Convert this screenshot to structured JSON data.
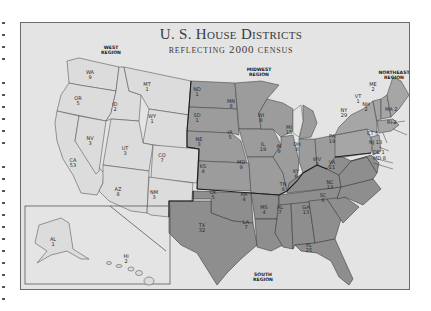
{
  "map": {
    "title": "U. S. House Districts",
    "subtitle": "reflecting 2000 census",
    "colors": {
      "background": "#e4e4e4",
      "west": "#dcdcdc",
      "midwest": "#9c9c9c",
      "south": "#8e8e8e",
      "northeast": "#a6a6a6",
      "frame": "#6a6a6a"
    },
    "regions": {
      "west": {
        "line1": "WEST",
        "line2": "REGION"
      },
      "midwest": {
        "line1": "MIDWEST",
        "line2": "REGION"
      },
      "northeast": {
        "line1": "NORTHEAST",
        "line2": "REGION"
      },
      "south": {
        "line1": "SOUTH",
        "line2": "REGION"
      }
    },
    "states": {
      "WA": {
        "abbr": "WA",
        "districts": "9"
      },
      "OR": {
        "abbr": "OR",
        "districts": "5"
      },
      "CA": {
        "abbr": "CA",
        "districts": "53"
      },
      "NV": {
        "abbr": "NV",
        "districts": "3"
      },
      "ID": {
        "abbr": "ID",
        "districts": "2"
      },
      "MT": {
        "abbr": "MT",
        "districts": "1"
      },
      "WY": {
        "abbr": "WY",
        "districts": "1"
      },
      "UT": {
        "abbr": "UT",
        "districts": "3"
      },
      "CO": {
        "abbr": "CO",
        "districts": "7"
      },
      "AZ": {
        "abbr": "AZ",
        "districts": "8"
      },
      "NM": {
        "abbr": "NM",
        "districts": "3"
      },
      "AK": {
        "abbr": "AL",
        "districts": "1"
      },
      "HI": {
        "abbr": "HI",
        "districts": "2"
      },
      "ND": {
        "abbr": "ND",
        "districts": "1"
      },
      "SD": {
        "abbr": "SD",
        "districts": "1"
      },
      "NE": {
        "abbr": "NE",
        "districts": "3"
      },
      "KS": {
        "abbr": "KS",
        "districts": "4"
      },
      "MN": {
        "abbr": "MN",
        "districts": "8"
      },
      "IA": {
        "abbr": "IA",
        "districts": "5"
      },
      "MO": {
        "abbr": "MO",
        "districts": "9"
      },
      "WI": {
        "abbr": "WI",
        "districts": "8"
      },
      "IL": {
        "abbr": "IL",
        "districts": "19"
      },
      "MI": {
        "abbr": "MI",
        "districts": "15"
      },
      "IN": {
        "abbr": "IN",
        "districts": "9"
      },
      "OH": {
        "abbr": "OH",
        "districts": "8"
      },
      "OK": {
        "abbr": "OK",
        "districts": "5"
      },
      "TX": {
        "abbr": "TX",
        "districts": "32"
      },
      "AR": {
        "abbr": "AR",
        "districts": "4"
      },
      "LA": {
        "abbr": "LA",
        "districts": "7"
      },
      "MS": {
        "abbr": "MS",
        "districts": "4"
      },
      "AL": {
        "abbr": "AL",
        "districts": "7"
      },
      "TN": {
        "abbr": "TN",
        "districts": "9"
      },
      "KY": {
        "abbr": "KY",
        "districts": "6"
      },
      "GA": {
        "abbr": "GA",
        "districts": "13"
      },
      "FL": {
        "abbr": "FL",
        "districts": "25"
      },
      "SC": {
        "abbr": "SC",
        "districts": "6"
      },
      "NC": {
        "abbr": "NC",
        "districts": "13"
      },
      "VA": {
        "abbr": "VA",
        "districts": "11"
      },
      "WV": {
        "abbr": "WV",
        "districts": "3"
      },
      "PA": {
        "abbr": "PA",
        "districts": "19"
      },
      "NY": {
        "abbr": "NY",
        "districts": "29"
      },
      "VT": {
        "abbr": "VT",
        "districts": "1"
      },
      "NH": {
        "abbr": "NH",
        "districts": "2"
      },
      "ME": {
        "abbr": "ME",
        "districts": "2"
      },
      "MA": {
        "abbr": "MA",
        "districts": "2"
      },
      "RI": {
        "abbr": "RI",
        "districts": "2"
      },
      "CT": {
        "abbr": "CT",
        "districts": "5"
      },
      "NJ": {
        "abbr": "NJ",
        "districts": "13"
      },
      "DE": {
        "abbr": "DE",
        "districts": "1"
      },
      "MD": {
        "abbr": "MD",
        "districts": "8"
      }
    }
  }
}
